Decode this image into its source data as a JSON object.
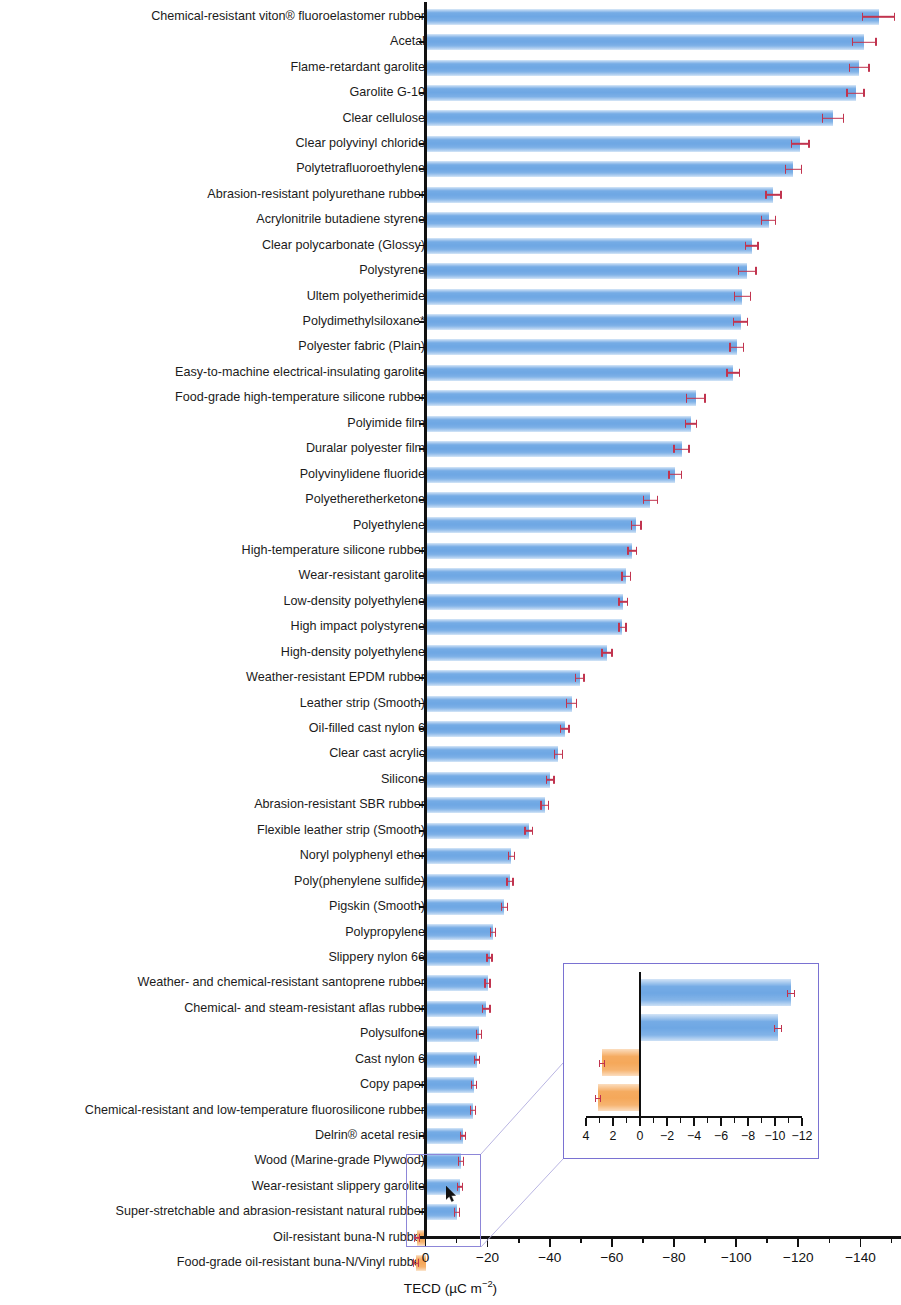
{
  "chart_data": {
    "type": "bar",
    "title": "",
    "subtitle": "",
    "xlabel": "TECD (µC m⁻²)",
    "ylabel": "",
    "orientation": "horizontal",
    "xlim": [
      0,
      -150
    ],
    "grid": false,
    "legend": null,
    "xticks_major": [
      0,
      -20,
      -40,
      -60,
      -80,
      -100,
      -120,
      -140
    ],
    "xticklabels": [
      "0",
      "−20",
      "−40",
      "−60",
      "−80",
      "−100",
      "−120",
      "−140"
    ],
    "note": "* denotes polydimethylsiloxane reference material",
    "bar_color_negative": "#6ea7e4",
    "bar_color_positive": "#f5a85a",
    "errorbar_color": "#c1344f",
    "callout_color": "#7a72d2",
    "categories": [
      "Chemical-resistant viton® fluoroelastomer rubber",
      "Acetal",
      "Flame-retardant garolite",
      "Garolite G-10",
      "Clear cellulose",
      "Clear polyvinyl chloride",
      "Polytetrafluoroethylene",
      "Abrasion-resistant polyurethane rubber",
      "Acrylonitrile butadiene styrene",
      "Clear polycarbonate (Glossy)",
      "Polystyrene",
      "Ultem polyetherimide",
      "Polydimethylsiloxane*",
      "Polyester fabric (Plain)",
      "Easy-to-machine electrical-insulating garolite",
      "Food-grade high-temperature silicone rubber",
      "Polyimide film",
      "Duralar polyester film",
      "Polyvinylidene fluoride",
      "Polyetheretherketone",
      "Polyethylene",
      "High-temperature silicone rubber",
      "Wear-resistant garolite",
      "Low-density polyethylene",
      "High impact polystyrene",
      "High-density polyethylene",
      "Weather-resistant EPDM rubber",
      "Leather strip (Smooth)",
      "Oil-filled cast nylon 6",
      "Clear cast acrylic",
      "Silicone",
      "Abrasion-resistant SBR rubber",
      "Flexible leather strip (Smooth)",
      "Noryl polyphenyl ether",
      "Poly(phenylene sulfide)",
      "Pigskin (Smooth)",
      "Polypropylene",
      "Slippery nylon 66",
      "Weather- and chemical-resistant santoprene rubber",
      "Chemical- and steam-resistant aflas rubber",
      "Polysulfone",
      "Cast nylon 6",
      "Copy paper",
      "Chemical-resistant and low-temperature fluorosilicone rubber",
      "Delrin® acetal resin",
      "Wood (Marine-grade Plywood)",
      "Wear-resistant slippery garolite",
      "Super-stretchable and abrasion-resistant natural rubber",
      "Oil-resistant buna-N rubber",
      "Food-grade oil-resistant buna-N/Vinyl rubber"
    ],
    "values": [
      -145.8,
      -141.2,
      -139.6,
      -138.4,
      -131.2,
      -120.6,
      -118.4,
      -112.0,
      -110.4,
      -105.0,
      -103.6,
      -102.0,
      -101.4,
      -100.2,
      -99.0,
      -87.0,
      -85.4,
      -82.4,
      -80.4,
      -72.4,
      -67.8,
      -66.6,
      -64.6,
      -63.6,
      -63.4,
      -58.4,
      -49.6,
      -47.0,
      -44.8,
      -42.8,
      -40.2,
      -38.4,
      -33.2,
      -27.6,
      -27.2,
      -25.4,
      -21.8,
      -20.6,
      -20.0,
      -19.6,
      -17.2,
      -16.6,
      -15.6,
      -15.2,
      -12.0,
      -11.4,
      -11.2,
      -10.2,
      2.8,
      3.1
    ],
    "errors": [
      5.4,
      4.0,
      3.4,
      3.0,
      3.6,
      3.0,
      2.8,
      2.6,
      2.4,
      2.2,
      3.0,
      2.8,
      2.4,
      2.4,
      2.2,
      3.2,
      2.0,
      2.6,
      2.2,
      2.4,
      1.8,
      1.6,
      1.6,
      1.6,
      1.4,
      1.8,
      1.6,
      1.8,
      1.6,
      1.6,
      1.4,
      1.4,
      1.4,
      1.2,
      1.2,
      1.2,
      1.0,
      1.0,
      1.0,
      1.4,
      0.9,
      0.9,
      0.8,
      0.8,
      0.7,
      0.7,
      0.6,
      0.6,
      0.4,
      0.4
    ]
  },
  "inset": {
    "type": "bar",
    "orientation": "horizontal",
    "xlim": [
      4,
      -12
    ],
    "xticks_major": [
      4,
      2,
      0,
      -2,
      -4,
      -6,
      -8,
      -10,
      -12
    ],
    "xticklabels": [
      "4",
      "2",
      "0",
      "−2",
      "−4",
      "−6",
      "−8",
      "−10",
      "−12"
    ],
    "categories": [
      "Wear-resistant slippery garolite",
      "Super-stretchable and abrasion-resistant natural rubber",
      "Oil-resistant buna-N rubber",
      "Food-grade oil-resistant buna-N/Vinyl rubber"
    ],
    "values": [
      -11.2,
      -10.2,
      2.8,
      3.1
    ],
    "errors": [
      0.6,
      0.6,
      0.4,
      0.4
    ]
  }
}
